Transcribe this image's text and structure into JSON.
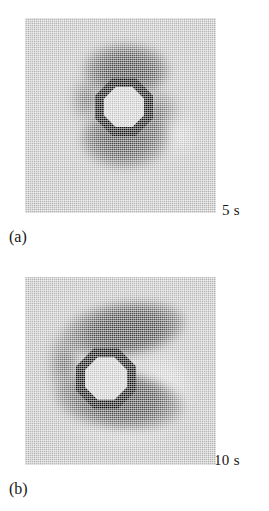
{
  "figure": {
    "type": "two-panel grayscale image figure",
    "background_color": "#ffffff",
    "panel_field_color": "#c9c9c9",
    "lobe_dark_color": "#454545",
    "ring_color": "#0b0b0b",
    "ring_core_color": "#d9d9d9"
  },
  "panels": [
    {
      "id": "a",
      "caption": "(a)",
      "time_label": "5 s",
      "object_shape": "octagon-ring",
      "lobes": "two dark lobes above and below the ring"
    },
    {
      "id": "b",
      "caption": "(b)",
      "time_label": "10 s",
      "object_shape": "octagon-ring",
      "lobes": "two elongated dark lobes sweeping to the right of the ring"
    }
  ]
}
